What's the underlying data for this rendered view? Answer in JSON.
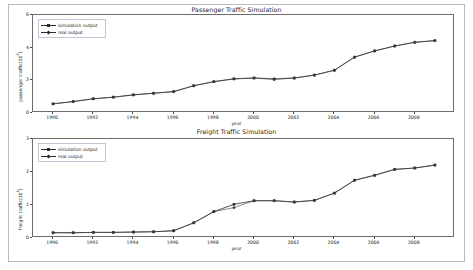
{
  "figure": {
    "background_color": "#ffffff",
    "frame_color": "#b9b9b9",
    "line_color": "#2a2a2a",
    "real_color": "#3a3a3a"
  },
  "legend": {
    "simulation_label": "simulation output",
    "real_label": "real output"
  },
  "chart_data": [
    {
      "type": "line",
      "title": "Passenger Traffic Simulation",
      "xlabel": "year",
      "ylabel": "passenger traffic(10^8)",
      "x": [
        1990,
        1991,
        1992,
        1993,
        1994,
        1995,
        1996,
        1997,
        1998,
        1999,
        2000,
        2001,
        2002,
        2003,
        2004,
        2005,
        2006,
        2007,
        2008,
        2009
      ],
      "xticks": [
        1990,
        1992,
        1994,
        1996,
        1998,
        2000,
        2002,
        2004,
        2006,
        2008
      ],
      "yticks": [
        0,
        2,
        4,
        6
      ],
      "xlim": [
        1989.0,
        2010.0
      ],
      "ylim": [
        0,
        6
      ],
      "grid": false,
      "legend_position": "upper left",
      "series": [
        {
          "name": "simulation output",
          "marker": "square",
          "values": [
            0.56,
            0.7,
            0.87,
            0.97,
            1.11,
            1.21,
            1.31,
            1.67,
            1.92,
            2.09,
            2.14,
            2.06,
            2.14,
            2.32,
            2.62,
            3.42,
            3.8,
            4.1,
            4.33,
            4.43
          ]
        },
        {
          "name": "real output",
          "marker": "diamond",
          "values": [
            0.56,
            0.7,
            0.87,
            0.97,
            1.11,
            1.21,
            1.31,
            1.67,
            1.92,
            2.09,
            2.15,
            2.1,
            2.14,
            2.32,
            2.62,
            3.42,
            3.8,
            4.1,
            4.33,
            4.43
          ]
        }
      ]
    },
    {
      "type": "line",
      "title": "Freight Traffic Simulation",
      "xlabel": "year",
      "ylabel": "freight traffic(10^8)",
      "x": [
        1990,
        1991,
        1992,
        1993,
        1994,
        1995,
        1996,
        1997,
        1998,
        1999,
        2000,
        2001,
        2002,
        2003,
        2004,
        2005,
        2006,
        2007,
        2008,
        2009
      ],
      "xticks": [
        1990,
        1992,
        1994,
        1996,
        1998,
        2000,
        2002,
        2004,
        2006,
        2008
      ],
      "yticks": [
        0,
        1,
        2,
        3
      ],
      "xlim": [
        1989.0,
        2010.0
      ],
      "ylim": [
        0,
        3
      ],
      "grid": false,
      "legend_position": "upper left",
      "series": [
        {
          "name": "simulation output",
          "marker": "square",
          "values": [
            0.16,
            0.16,
            0.17,
            0.17,
            0.18,
            0.19,
            0.22,
            0.46,
            0.8,
            1.02,
            1.13,
            1.13,
            1.09,
            1.14,
            1.36,
            1.75,
            1.9,
            2.08,
            2.12,
            2.21
          ]
        },
        {
          "name": "real output",
          "marker": "diamond",
          "values": [
            0.16,
            0.16,
            0.17,
            0.17,
            0.18,
            0.19,
            0.22,
            0.46,
            0.8,
            0.92,
            1.13,
            1.13,
            1.09,
            1.14,
            1.36,
            1.75,
            1.9,
            2.08,
            2.12,
            2.21
          ]
        }
      ]
    }
  ]
}
